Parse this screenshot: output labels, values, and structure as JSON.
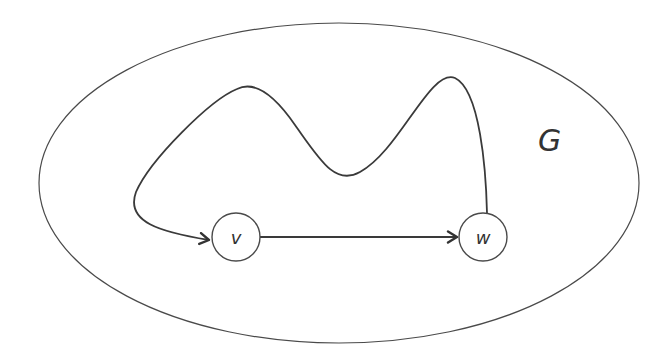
{
  "diagram": {
    "type": "graph-path-illustration",
    "graph_label": "G",
    "nodes": [
      {
        "id": "v",
        "label": "v",
        "cx": 236,
        "cy": 237,
        "r": 24
      },
      {
        "id": "w",
        "label": "w",
        "cx": 483,
        "cy": 237,
        "r": 24
      }
    ],
    "edges": [
      {
        "from": "v",
        "to": "w",
        "style": "straight-arrow"
      },
      {
        "from": "w",
        "to": "v",
        "style": "curved-path-arrow"
      }
    ],
    "colors": {
      "stroke": "#3a3a3a",
      "text": "#333333",
      "background": "#ffffff"
    }
  }
}
